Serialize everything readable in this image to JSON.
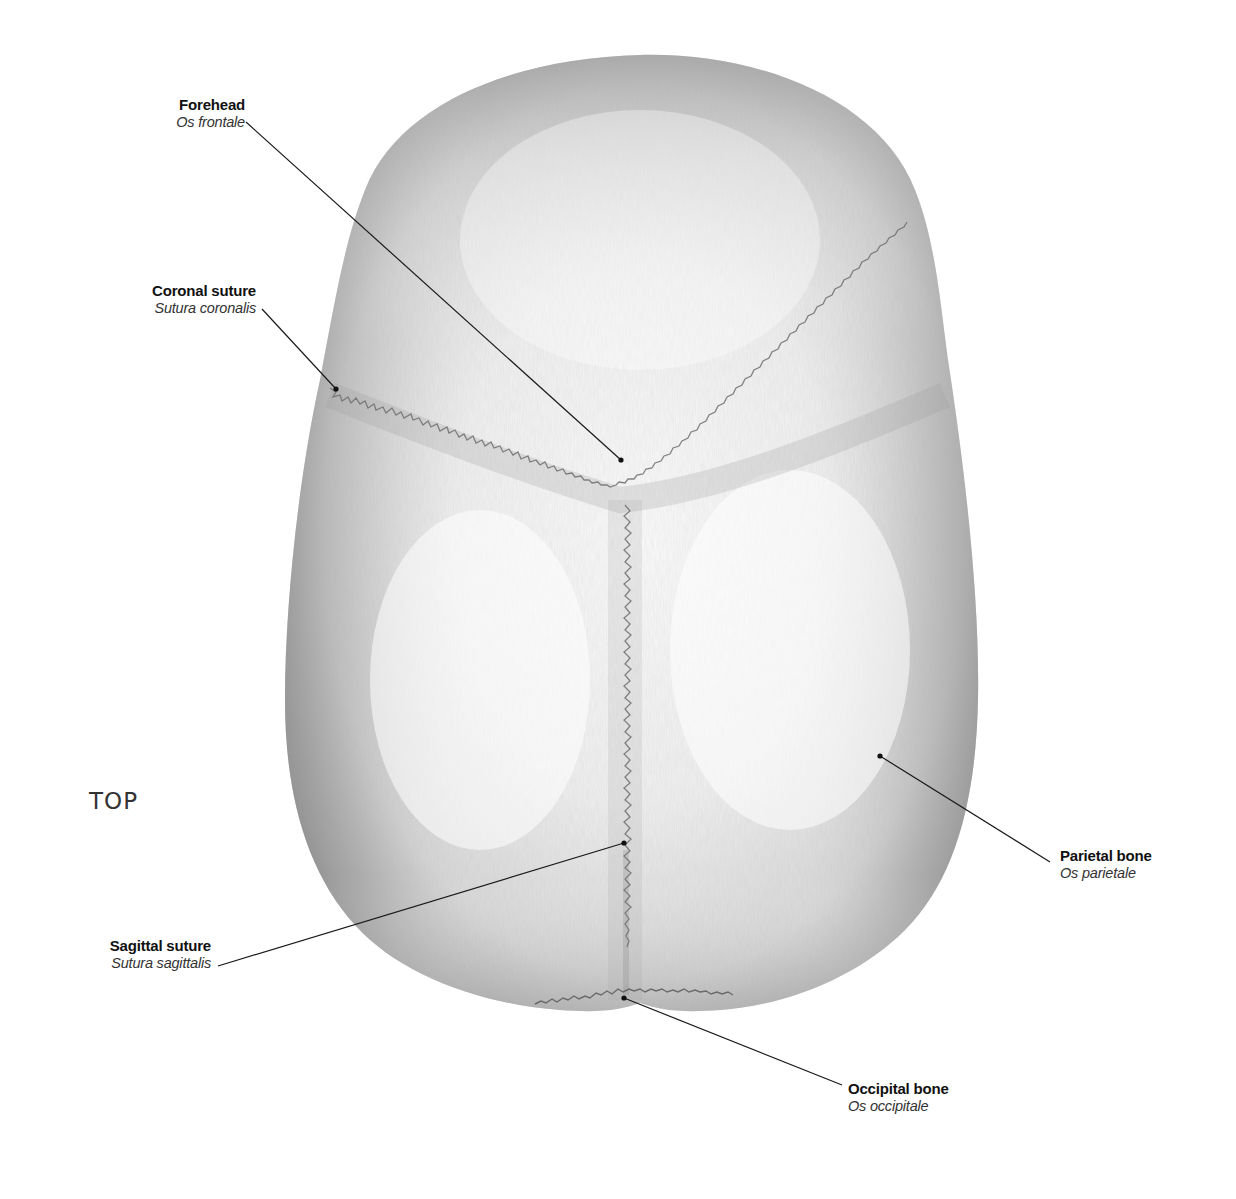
{
  "view": {
    "label": "TOP"
  },
  "labels": {
    "forehead": {
      "common": "Forehead",
      "latin": "Os frontale"
    },
    "coronal_suture": {
      "common": "Coronal suture",
      "latin": "Sutura coronalis"
    },
    "sagittal_suture": {
      "common": "Sagittal suture",
      "latin": "Sutura sagittalis"
    },
    "parietal_bone": {
      "common": "Parietal bone",
      "latin": "Os parietale"
    },
    "occipital_bone": {
      "common": "Occipital bone",
      "latin": "Os occipitale"
    }
  },
  "colors": {
    "background": "#ffffff",
    "bone_light": "#f4f4f4",
    "bone_mid": "#c9c9c9",
    "bone_dark": "#8c8c8c",
    "leader_line": "#1a1a1a"
  }
}
